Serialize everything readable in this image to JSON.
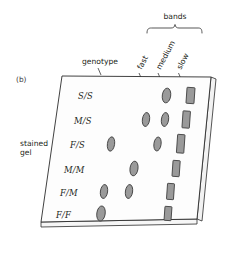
{
  "figure": {
    "panel_label": "(b)",
    "left_caption_line1": "stained",
    "left_caption_line2": "gel",
    "genotype_header": "genotype",
    "bands_header": "bands",
    "band_columns": [
      {
        "id": "fast",
        "label": "fast"
      },
      {
        "id": "medium",
        "label": "medium"
      },
      {
        "id": "slow",
        "label": "slow"
      }
    ],
    "rows": [
      {
        "genotype": "S/S",
        "bands": [
          "medium",
          "slow"
        ]
      },
      {
        "genotype": "M/S",
        "bands": [
          "fast",
          "medium",
          "slow"
        ]
      },
      {
        "genotype": "F/S",
        "bands": [
          "fast",
          "medium",
          "slow"
        ]
      },
      {
        "genotype": "M/M",
        "bands": [
          "fast",
          "slow"
        ]
      },
      {
        "genotype": "F/M",
        "bands": [
          "fast",
          "medium",
          "slow"
        ]
      },
      {
        "genotype": "F/F",
        "bands": [
          "fast",
          "slow"
        ]
      }
    ],
    "colors": {
      "band_fill": "#9a9a9a",
      "band_outline": "#3a3a3a",
      "gel_face": "#fdfdfd",
      "outline": "#2b2b2b",
      "text": "#231f20"
    }
  }
}
